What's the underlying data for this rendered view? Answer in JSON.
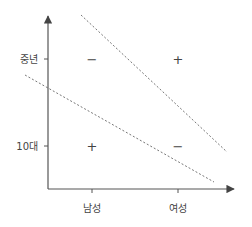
{
  "diagram": {
    "type": "quadrant-interaction-diagram",
    "y_axis": {
      "ticks": [
        {
          "label": "중년",
          "y": 59
        },
        {
          "label": "10대",
          "y": 146
        }
      ]
    },
    "x_axis": {
      "ticks": [
        {
          "label": "남성",
          "x": 92
        },
        {
          "label": "여성",
          "x": 178
        }
      ]
    },
    "cells": [
      {
        "position": "중년-남성",
        "sign": "−"
      },
      {
        "position": "중년-여성",
        "sign": "+"
      },
      {
        "position": "10대-남성",
        "sign": "+"
      },
      {
        "position": "10대-여성",
        "sign": "−"
      }
    ],
    "dashed_lines": [
      {
        "name": "upper-boundary",
        "x1": 81,
        "y1": 15,
        "x2": 227,
        "y2": 152
      },
      {
        "name": "lower-boundary",
        "x1": 25,
        "y1": 75,
        "x2": 214,
        "y2": 182
      }
    ],
    "colors": {
      "axis": "#555555",
      "dash": "#777777",
      "text": "#444444"
    }
  }
}
